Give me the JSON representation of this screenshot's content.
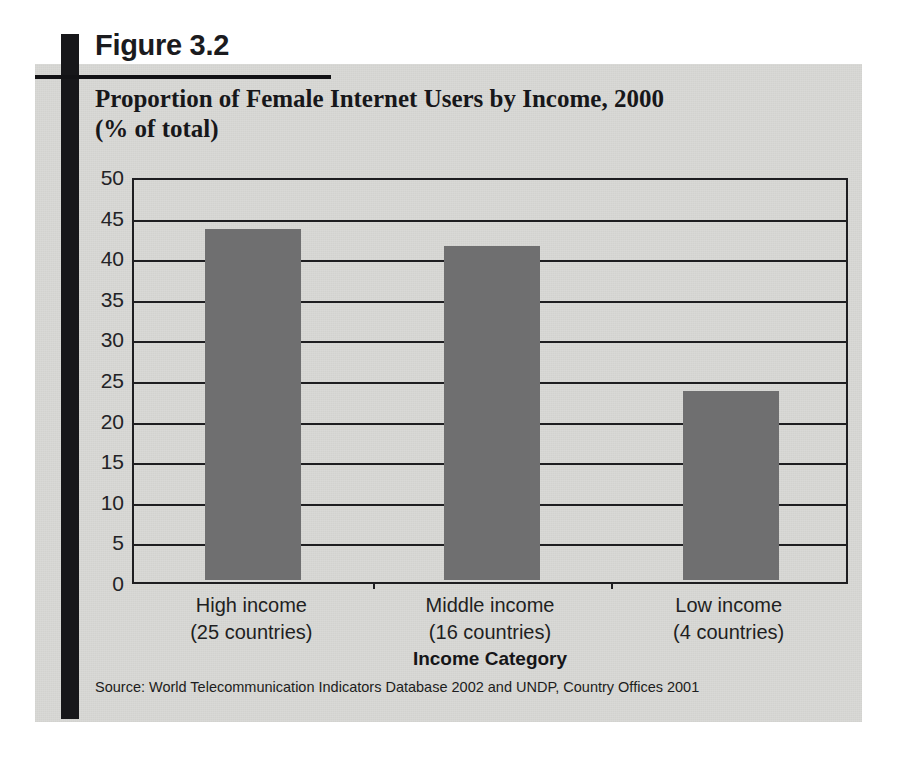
{
  "figure": {
    "number_label": "Figure 3.2",
    "title_line1": "Proportion of Female Internet Users by Income, 2000",
    "title_line2": "(% of total)",
    "source": "Source: World Telecommunication Indicators Database 2002 and UNDP, Country Offices 2001"
  },
  "colors": {
    "panel_background": "#d9d9d6",
    "bar_fill": "#6f6f70",
    "axis_line": "#1e1e21",
    "rule": "#131316",
    "text": "#17171a"
  },
  "chart_data": {
    "type": "bar",
    "title": "Proportion of Female Internet Users by Income, 2000 (% of total)",
    "xlabel": "Income Category",
    "ylabel": "",
    "ylim": [
      0,
      50
    ],
    "ytick_step": 5,
    "yticks": [
      "50",
      "45",
      "40",
      "35",
      "30",
      "25",
      "20",
      "15",
      "10",
      "5",
      "0"
    ],
    "grid": true,
    "legend": false,
    "categories": [
      "High income\n(25 countries)",
      "Middle income\n(16 countries)",
      "Low income\n(4 countries)"
    ],
    "category_lines": [
      {
        "name": "High income",
        "detail": "(25 countries)"
      },
      {
        "name": "Middle income",
        "detail": "(16 countries)"
      },
      {
        "name": "Low income",
        "detail": "(4 countries)"
      }
    ],
    "values": [
      43.5,
      41.4,
      23.5
    ],
    "series": [
      {
        "name": "Female Internet users (% of total)",
        "values": [
          43.5,
          41.4,
          23.5
        ]
      }
    ]
  }
}
